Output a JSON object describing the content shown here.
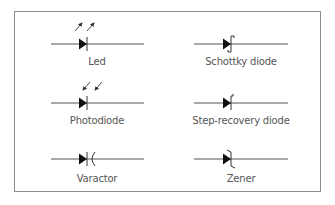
{
  "colors": {
    "stroke": "#3a3a3a",
    "fill": "#111111",
    "border": "#8c8c8c",
    "label": "#555555"
  },
  "symbols": [
    {
      "id": "led",
      "label": "Led",
      "column": "left",
      "row": 0,
      "modifier": "emitting-arrows"
    },
    {
      "id": "schottky",
      "label": "Schottky diode",
      "column": "right",
      "row": 0,
      "modifier": "s-bar"
    },
    {
      "id": "photodiode",
      "label": "Photodiode",
      "column": "left",
      "row": 1,
      "modifier": "receiving-arrows"
    },
    {
      "id": "step-recovery",
      "label": "Step-recovery diode",
      "column": "right",
      "row": 1,
      "modifier": "hook-bar"
    },
    {
      "id": "varactor",
      "label": "Varactor",
      "column": "left",
      "row": 2,
      "modifier": "capacitor-bar"
    },
    {
      "id": "zener",
      "label": "Zener",
      "column": "right",
      "row": 2,
      "modifier": "z-bar"
    }
  ]
}
